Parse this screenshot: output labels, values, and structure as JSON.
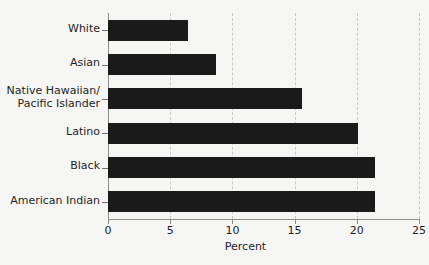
{
  "chart_data": {
    "type": "bar",
    "orientation": "horizontal",
    "title": "",
    "xlabel": "Percent",
    "ylabel": "",
    "categories": [
      "White",
      "Asian",
      "Native Hawaiian/\nPacific Islander",
      "Latino",
      "Black",
      "American Indian"
    ],
    "values": [
      6.4,
      8.7,
      15.6,
      20.1,
      21.5,
      21.5
    ],
    "xlim": [
      0,
      25
    ],
    "xticks": [
      0,
      5,
      10,
      15,
      20,
      25
    ],
    "xtick_labels": [
      "0",
      "5",
      "10",
      "15",
      "20",
      "25"
    ],
    "grid": "vertical-dashed",
    "legend": "none",
    "bar_color": "#1a1a1a",
    "background_color": "#f5f5f3",
    "axis_color": "#8d8d8b",
    "gridline_color": "#c9c9c7"
  }
}
